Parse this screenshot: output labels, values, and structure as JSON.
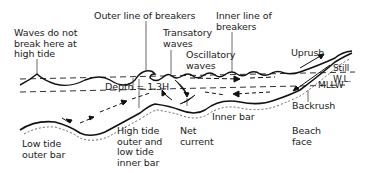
{
  "diagram": {
    "type": "beach profile cross-section",
    "labels": {
      "waves_no_break": "Waves do not\nbreak here at\nhigh tide",
      "outer_breakers": "Outer line of breakers",
      "transatory_waves": "Transatory\nwaves",
      "inner_breakers": "Inner line of\nbreakers",
      "oscillatory_waves": "Oscillatory\nwaves",
      "uprush": "Uprush",
      "still_wl": "Still\nW.L.",
      "mllw": "MLLW",
      "depth": "Depth = 1.3H",
      "backrush": "Backrush",
      "low_tide_outer_bar": "Low tide\nouter bar",
      "high_tide_bar": "High tide\nouter and\nlow tide\ninner bar",
      "net_current": "Net\ncurrent",
      "inner_bar": "Inner bar",
      "beach_face": "Beach\nface"
    },
    "colors": {
      "line": "#222222",
      "background": "#ffffff"
    }
  }
}
